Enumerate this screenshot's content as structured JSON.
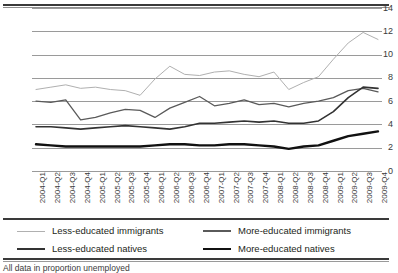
{
  "chart_data": {
    "type": "line",
    "title": "",
    "xlabel": "",
    "ylabel": "",
    "ylim": [
      0,
      14
    ],
    "ytick_step": 2,
    "yticks": [
      14,
      12,
      10,
      8,
      6,
      4,
      2,
      0
    ],
    "grid": true,
    "legend_position": "bottom",
    "categories": [
      "2004-Q1",
      "2004-Q2",
      "2004-Q3",
      "2004-Q4",
      "2005-Q1",
      "2005-Q2",
      "2005-Q3",
      "2005-Q4",
      "2006-Q1",
      "2006-Q2",
      "2006-Q3",
      "2006-Q4",
      "2007-Q1",
      "2007-Q2",
      "2007-Q3",
      "2007-Q4",
      "2008-Q1",
      "2008-Q2",
      "2008-Q3",
      "2008-Q4",
      "2009-Q1",
      "2009-Q2",
      "2009-Q3",
      "2009-Q4"
    ],
    "series": [
      {
        "name": "Less-educated immigrants",
        "color": "#b0b0b0",
        "width": 1.0,
        "values": [
          7.0,
          7.2,
          7.4,
          7.1,
          7.2,
          7.0,
          6.9,
          6.5,
          7.9,
          9.0,
          8.3,
          8.2,
          8.5,
          8.6,
          8.3,
          8.1,
          8.5,
          7.0,
          7.6,
          8.1,
          9.6,
          11.0,
          11.9,
          11.3
        ]
      },
      {
        "name": "More-educated immigrants",
        "color": "#5a5a5a",
        "width": 1.3,
        "values": [
          6.0,
          5.9,
          6.1,
          4.4,
          4.6,
          5.0,
          5.3,
          5.2,
          4.6,
          5.4,
          5.9,
          6.4,
          5.6,
          5.8,
          6.1,
          5.7,
          5.8,
          5.5,
          5.8,
          6.0,
          6.3,
          6.9,
          7.1,
          6.8
        ]
      },
      {
        "name": "Less-educated natives",
        "color": "#333333",
        "width": 1.6,
        "values": [
          3.8,
          3.8,
          3.7,
          3.6,
          3.7,
          3.8,
          3.9,
          3.8,
          3.7,
          3.6,
          3.8,
          4.1,
          4.1,
          4.2,
          4.3,
          4.2,
          4.3,
          4.1,
          4.1,
          4.3,
          5.1,
          6.3,
          7.2,
          7.1
        ]
      },
      {
        "name": "More-educated natives",
        "color": "#111111",
        "width": 2.4,
        "values": [
          2.3,
          2.2,
          2.1,
          2.1,
          2.1,
          2.1,
          2.1,
          2.1,
          2.2,
          2.3,
          2.3,
          2.2,
          2.2,
          2.3,
          2.3,
          2.2,
          2.1,
          1.9,
          2.1,
          2.2,
          2.6,
          3.0,
          3.2,
          3.4
        ]
      }
    ]
  },
  "legend": {
    "entries": [
      {
        "label": "Less-educated immigrants"
      },
      {
        "label": "More-educated immigrants"
      },
      {
        "label": "Less-educated natives"
      },
      {
        "label": "More-educated natives"
      }
    ]
  },
  "footnote": {
    "text": "All data in proportion unemployed"
  }
}
